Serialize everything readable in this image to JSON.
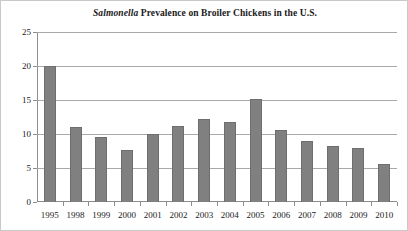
{
  "chart_data": {
    "type": "bar",
    "title": "Salmonella Prevalence on Broiler Chickens in the U.S.",
    "title_parts": {
      "italic": "Salmonella",
      "rest": " Prevalence on Broiler Chickens in the U.S."
    },
    "xlabel": "",
    "ylabel": "",
    "ylim": [
      0,
      25
    ],
    "yticks": [
      0,
      5,
      10,
      15,
      20,
      25
    ],
    "ytick_labels": [
      "0",
      "5",
      "10",
      "15",
      "20",
      "25"
    ],
    "grid": "horizontal",
    "legend": "none",
    "bar_color": "#808080",
    "categories": [
      "1995",
      "1998",
      "1999",
      "2000",
      "2001",
      "2002",
      "2003",
      "2004",
      "2005",
      "2006",
      "2007",
      "2008",
      "2009",
      "2010"
    ],
    "values": [
      20.0,
      11.0,
      9.6,
      7.7,
      10.0,
      11.2,
      12.2,
      11.8,
      15.2,
      10.6,
      9.0,
      8.3,
      8.0,
      5.6
    ],
    "points": [
      {
        "category": "1995",
        "value": 20.0
      },
      {
        "category": "1998",
        "value": 11.0
      },
      {
        "category": "1999",
        "value": 9.6
      },
      {
        "category": "2000",
        "value": 7.7
      },
      {
        "category": "2001",
        "value": 10.0
      },
      {
        "category": "2002",
        "value": 11.2
      },
      {
        "category": "2003",
        "value": 12.2
      },
      {
        "category": "2004",
        "value": 11.8
      },
      {
        "category": "2005",
        "value": 15.2
      },
      {
        "category": "2006",
        "value": 10.6
      },
      {
        "category": "2007",
        "value": 9.0
      },
      {
        "category": "2008",
        "value": 8.3
      },
      {
        "category": "2009",
        "value": 8.0
      },
      {
        "category": "2010",
        "value": 5.6
      }
    ]
  }
}
